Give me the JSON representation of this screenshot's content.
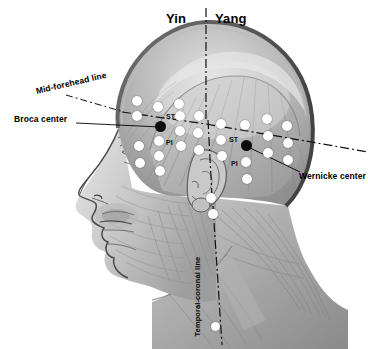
{
  "labels": {
    "yin": "Yin",
    "yang": "Yang",
    "mid_forehead_line": "Mid-forehead line",
    "broca_center": "Broca center",
    "wernicke_center": "Wernicke center",
    "temporal_coronal_line": "Temporal-coronal line"
  },
  "point_labels": {
    "st_left": "ST",
    "pi_left": "PI",
    "st_right": "ST",
    "pi_right": "PI"
  },
  "colors": {
    "point_white": "#ffffff",
    "point_black": "#0b0b0b",
    "leader_line": "#000000",
    "axis_line": "#111111",
    "background": "#ffffff",
    "artwork_light": "#d9d9d9",
    "artwork_mid": "#9b9b9b",
    "artwork_dark": "#5d5d5d"
  },
  "lines": [
    {
      "name": "vertical-yin-yang-axis",
      "style": "dash-dot",
      "orientation": "vertical"
    },
    {
      "name": "mid-forehead-horizontal-line",
      "style": "dash-dot",
      "orientation": "horizontal"
    },
    {
      "name": "temporal-coronal-vertical-line",
      "style": "dash-dot",
      "orientation": "vertical"
    },
    {
      "name": "broca-leader",
      "style": "solid",
      "orientation": "horizontal"
    },
    {
      "name": "wernicke-leader",
      "style": "solid",
      "orientation": "diagonal"
    },
    {
      "name": "mid-forehead-leader",
      "style": "dash-dot",
      "orientation": "diagonal"
    }
  ],
  "points": {
    "black": [
      {
        "name": "broca-center-point",
        "x": 160,
        "y": 126
      },
      {
        "name": "wernicke-center-point",
        "x": 246,
        "y": 145
      }
    ],
    "white": [
      {
        "x": 137,
        "y": 101
      },
      {
        "x": 158,
        "y": 107
      },
      {
        "x": 179,
        "y": 104
      },
      {
        "x": 137,
        "y": 116
      },
      {
        "x": 158,
        "y": 113
      },
      {
        "x": 180,
        "y": 116
      },
      {
        "x": 159,
        "y": 141
      },
      {
        "x": 180,
        "y": 131
      },
      {
        "x": 139,
        "y": 146
      },
      {
        "x": 159,
        "y": 156
      },
      {
        "x": 181,
        "y": 146
      },
      {
        "x": 140,
        "y": 163
      },
      {
        "x": 160,
        "y": 171
      },
      {
        "x": 199,
        "y": 116
      },
      {
        "x": 198,
        "y": 133
      },
      {
        "x": 199,
        "y": 150
      },
      {
        "x": 221,
        "y": 124
      },
      {
        "x": 221,
        "y": 140
      },
      {
        "x": 222,
        "y": 156
      },
      {
        "x": 245,
        "y": 125
      },
      {
        "x": 246,
        "y": 162
      },
      {
        "x": 247,
        "y": 179
      },
      {
        "x": 267,
        "y": 119
      },
      {
        "x": 268,
        "y": 136
      },
      {
        "x": 268,
        "y": 153
      },
      {
        "x": 287,
        "y": 126
      },
      {
        "x": 288,
        "y": 143
      },
      {
        "x": 288,
        "y": 160
      },
      {
        "x": 211,
        "y": 198
      },
      {
        "x": 213,
        "y": 214
      },
      {
        "x": 216,
        "y": 327
      }
    ]
  }
}
